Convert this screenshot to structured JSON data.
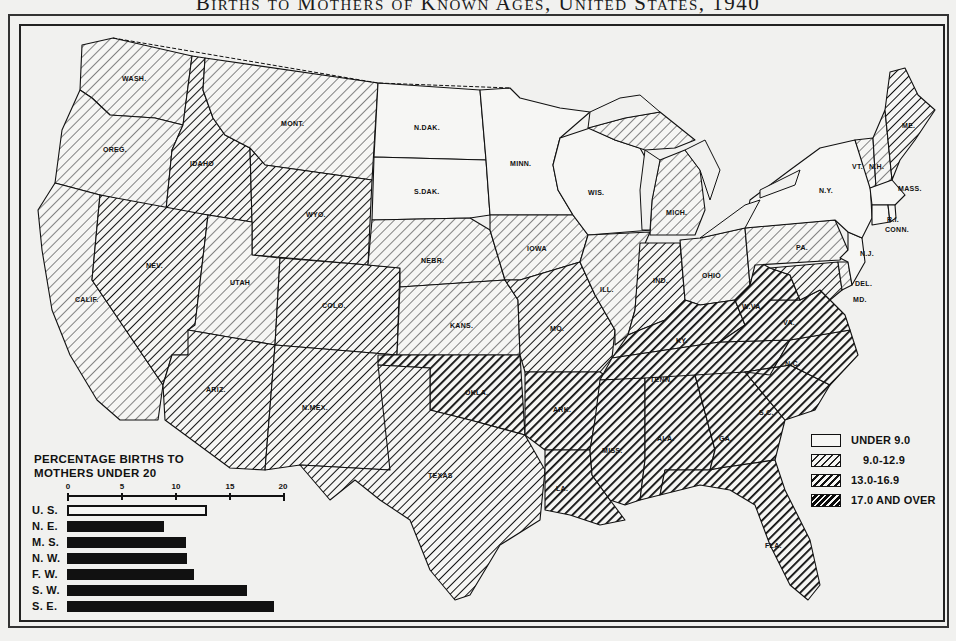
{
  "title": "Births to Mothers of Known Ages, United States, 1940",
  "colors": {
    "background": "#f1f1ef",
    "ink": "#111111",
    "under_9": "#f6f6f4"
  },
  "frame": {
    "top_ticks": [
      "125",
      "120",
      "115",
      "110",
      "105",
      "100",
      "95",
      "90",
      "85",
      "80",
      "75",
      "70"
    ],
    "bottom_ticks": [
      "115",
      "110",
      "105",
      "100",
      "95",
      "90",
      "85",
      "80",
      "75"
    ]
  },
  "legend": {
    "items": [
      {
        "label": "UNDER 9.0",
        "category": "under_9"
      },
      {
        "label": "9.0-12.9",
        "category": "light_hatch"
      },
      {
        "label": "13.0-16.9",
        "category": "medium_hatch"
      },
      {
        "label": "17.0 AND OVER",
        "category": "dark_hatch"
      }
    ]
  },
  "states": [
    {
      "abbr": "WASH.",
      "category": "light_hatch"
    },
    {
      "abbr": "OREG.",
      "category": "light_hatch"
    },
    {
      "abbr": "CALIF.",
      "category": "light_hatch"
    },
    {
      "abbr": "IDAHO",
      "category": "medium_hatch"
    },
    {
      "abbr": "NEV.",
      "category": "medium_hatch"
    },
    {
      "abbr": "MONT.",
      "category": "light_hatch"
    },
    {
      "abbr": "WYO.",
      "category": "medium_hatch"
    },
    {
      "abbr": "UTAH",
      "category": "light_hatch"
    },
    {
      "abbr": "COLO.",
      "category": "medium_hatch"
    },
    {
      "abbr": "ARIZ.",
      "category": "medium_hatch"
    },
    {
      "abbr": "N.MEX.",
      "category": "medium_hatch"
    },
    {
      "abbr": "N.DAK.",
      "category": "under_9"
    },
    {
      "abbr": "S.DAK.",
      "category": "under_9"
    },
    {
      "abbr": "NEBR.",
      "category": "light_hatch"
    },
    {
      "abbr": "KANS.",
      "category": "light_hatch"
    },
    {
      "abbr": "OKLA.",
      "category": "dark_hatch"
    },
    {
      "abbr": "TEXAS",
      "category": "medium_hatch"
    },
    {
      "abbr": "MINN.",
      "category": "under_9"
    },
    {
      "abbr": "IOWA",
      "category": "light_hatch"
    },
    {
      "abbr": "MO.",
      "category": "medium_hatch"
    },
    {
      "abbr": "ARK.",
      "category": "dark_hatch"
    },
    {
      "abbr": "LA.",
      "category": "dark_hatch"
    },
    {
      "abbr": "WIS.",
      "category": "under_9"
    },
    {
      "abbr": "ILL.",
      "category": "light_hatch"
    },
    {
      "abbr": "MICH.",
      "category": "light_hatch"
    },
    {
      "abbr": "IND.",
      "category": "medium_hatch"
    },
    {
      "abbr": "OHIO",
      "category": "light_hatch"
    },
    {
      "abbr": "KY.",
      "category": "dark_hatch"
    },
    {
      "abbr": "TENN.",
      "category": "dark_hatch"
    },
    {
      "abbr": "MISS.",
      "category": "dark_hatch"
    },
    {
      "abbr": "ALA.",
      "category": "dark_hatch"
    },
    {
      "abbr": "GA.",
      "category": "dark_hatch"
    },
    {
      "abbr": "FLA.",
      "category": "dark_hatch"
    },
    {
      "abbr": "S.C.",
      "category": "dark_hatch"
    },
    {
      "abbr": "N.C.",
      "category": "dark_hatch"
    },
    {
      "abbr": "VA.",
      "category": "dark_hatch"
    },
    {
      "abbr": "W.VA.",
      "category": "dark_hatch"
    },
    {
      "abbr": "PA.",
      "category": "light_hatch"
    },
    {
      "abbr": "N.Y.",
      "category": "under_9"
    },
    {
      "abbr": "N.J.",
      "category": "under_9"
    },
    {
      "abbr": "DEL.",
      "category": "light_hatch"
    },
    {
      "abbr": "MD.",
      "category": "medium_hatch"
    },
    {
      "abbr": "VT.",
      "category": "light_hatch"
    },
    {
      "abbr": "N.H.",
      "category": "light_hatch"
    },
    {
      "abbr": "ME.",
      "category": "medium_hatch"
    },
    {
      "abbr": "MASS.",
      "category": "under_9"
    },
    {
      "abbr": "R.I.",
      "category": "under_9"
    },
    {
      "abbr": "CONN.",
      "category": "under_9"
    }
  ],
  "chart_data": {
    "type": "bar",
    "orientation": "horizontal",
    "title": "PERCENTAGE BIRTHS TO MOTHERS UNDER 20",
    "xlabel": "",
    "ylabel": "",
    "xlim": [
      0,
      20
    ],
    "xticks": [
      "0",
      "5",
      "10",
      "15",
      "20"
    ],
    "categories": [
      "U. S.",
      "N. E.",
      "M. S.",
      "N. W.",
      "F. W.",
      "S. W.",
      "S. E."
    ],
    "values": [
      13.0,
      9.0,
      11.0,
      11.1,
      11.8,
      16.7,
      19.2
    ],
    "styles": [
      "outline",
      "solid",
      "solid",
      "solid",
      "solid",
      "solid",
      "solid"
    ]
  }
}
